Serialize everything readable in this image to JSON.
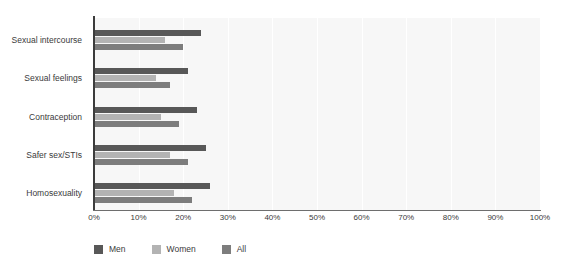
{
  "chart_data": {
    "type": "bar",
    "orientation": "horizontal",
    "title": "",
    "xlabel": "",
    "ylabel": "",
    "xlim": [
      0,
      100
    ],
    "xtick_labels": [
      "0%",
      "10%",
      "20%",
      "30%",
      "40%",
      "50%",
      "60%",
      "70%",
      "80%",
      "90%",
      "100%"
    ],
    "xtick_values": [
      0,
      10,
      20,
      30,
      40,
      50,
      60,
      70,
      80,
      90,
      100
    ],
    "grid": true,
    "legend_position": "bottom-left",
    "categories": [
      "Sexual intercourse",
      "Sexual feelings",
      "Contraception",
      "Safer sex/STIs",
      "Homosexuality"
    ],
    "series": [
      {
        "name": "Men",
        "color": "#585858",
        "values": [
          24,
          21,
          23,
          25,
          26
        ]
      },
      {
        "name": "Women",
        "color": "#b3b3b3",
        "values": [
          16,
          14,
          15,
          17,
          18
        ]
      },
      {
        "name": "All",
        "color": "#7d7d7d",
        "values": [
          20,
          17,
          19,
          21,
          22
        ]
      }
    ]
  },
  "colors": {
    "plot_background": "#f7f7f7",
    "gridline": "#ffffff",
    "axis": "#3c3c3c",
    "text": "#3a3a3a",
    "page_background": "#ffffff"
  }
}
